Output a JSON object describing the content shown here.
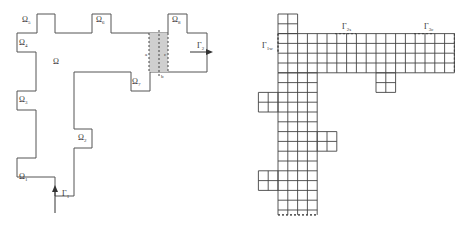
{
  "left_diagram": {
    "domain_label": "Ω",
    "subdomains": [
      {
        "name": "Ω",
        "sub": "1"
      },
      {
        "name": "Ω",
        "sub": "2"
      },
      {
        "name": "Ω",
        "sub": "3"
      },
      {
        "name": "Ω",
        "sub": "4"
      },
      {
        "name": "Ω",
        "sub": "5"
      },
      {
        "name": "Ω",
        "sub": "6"
      },
      {
        "name": "Ω",
        "sub": "7"
      },
      {
        "name": "Ω",
        "sub": "8"
      }
    ],
    "inlet": {
      "name": "Γ",
      "sub": "1"
    },
    "outlet": {
      "name": "Γ",
      "sub": "2"
    },
    "interface_labels": [
      "a",
      "c",
      "b"
    ]
  },
  "right_diagram": {
    "boundary_labels": [
      {
        "name": "Γ",
        "sub": "1w"
      },
      {
        "name": "Γ",
        "sub": "2s"
      },
      {
        "name": "Γ",
        "sub": "3c"
      }
    ]
  }
}
